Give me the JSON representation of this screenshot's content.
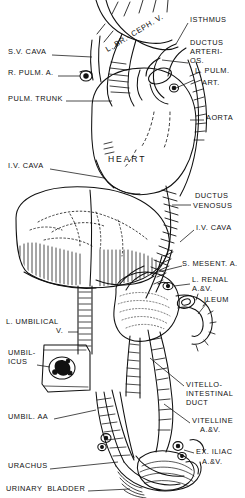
{
  "figure": {
    "width": 245,
    "height": 498,
    "ink_color": "#111111",
    "background_color": "#ffffff",
    "style": "pen-and-ink line engraving"
  },
  "labels_left": [
    {
      "id": "sv-cava",
      "text": "S.V. CAVA",
      "x": 8,
      "y": 52,
      "leader_to": [
        92,
        57
      ]
    },
    {
      "id": "r-pulm-a",
      "text": "R. PULM. A.",
      "x": 8,
      "y": 73,
      "leader_to": [
        84,
        76
      ]
    },
    {
      "id": "pulm-trunk",
      "text": "PULM. TRUNK",
      "x": 8,
      "y": 99,
      "leader_to": [
        112,
        100
      ]
    },
    {
      "id": "iv-cava-upper",
      "text": "I.V. CAVA",
      "x": 8,
      "y": 166,
      "leader_to": [
        102,
        176
      ]
    },
    {
      "id": "l-umbilical-v",
      "text": "L. UMBILICAL",
      "x": 6,
      "y": 322,
      "leader_to": null
    },
    {
      "id": "l-umbilical-v2",
      "text": "V.",
      "x": 56,
      "y": 331,
      "leader_to": [
        80,
        332
      ]
    },
    {
      "id": "umbilicus-1",
      "text": "UMBIL-",
      "x": 8,
      "y": 353,
      "leader_to": null
    },
    {
      "id": "umbilicus-2",
      "text": "ICUS",
      "x": 8,
      "y": 362,
      "leader_to": [
        50,
        366
      ]
    },
    {
      "id": "umbil-aa",
      "text": "UMBIL. AA",
      "x": 8,
      "y": 417,
      "leader_to": [
        72,
        412
      ]
    },
    {
      "id": "urachus",
      "text": "URACHUS",
      "x": 8,
      "y": 466,
      "leader_to": [
        92,
        468
      ]
    },
    {
      "id": "urinary-bladder",
      "text": "URINARY  BLADDER",
      "x": 6,
      "y": 489,
      "leader_to": [
        118,
        488
      ]
    }
  ],
  "labels_right": [
    {
      "id": "isthmus",
      "text": "ISTHMUS",
      "x": 190,
      "y": 20,
      "leader_to": [
        176,
        44
      ]
    },
    {
      "id": "ductus-arteriosus-1",
      "text": "DUCTUS",
      "x": 190,
      "y": 43,
      "leader_to": null
    },
    {
      "id": "ductus-arteriosus-2",
      "text": "ARTERI-",
      "x": 190,
      "y": 52,
      "leader_to": null
    },
    {
      "id": "ductus-arteriosus-3",
      "text": "OS.",
      "x": 190,
      "y": 61,
      "leader_to": [
        168,
        66
      ]
    },
    {
      "id": "l-pulm-art-1",
      "text": "L. PULM.",
      "x": 195,
      "y": 71,
      "leader_to": null
    },
    {
      "id": "l-pulm-art-2",
      "text": "ART.",
      "x": 202,
      "y": 83,
      "leader_to": [
        170,
        84
      ]
    },
    {
      "id": "aorta",
      "text": "AORTA",
      "x": 206,
      "y": 118,
      "leader_to": [
        190,
        120
      ]
    },
    {
      "id": "ductus-venosus-1",
      "text": "DUCTUS",
      "x": 195,
      "y": 196,
      "leader_to": null
    },
    {
      "id": "ductus-venosus-2",
      "text": "VENOSUS",
      "x": 193,
      "y": 206,
      "leader_to": [
        176,
        207
      ]
    },
    {
      "id": "iv-cava-lower",
      "text": "I.V. CAVA",
      "x": 196,
      "y": 228,
      "leader_to": [
        180,
        238
      ]
    },
    {
      "id": "s-mesent-a",
      "text": "S. MESENT. A.",
      "x": 184,
      "y": 264,
      "leader_to": [
        160,
        272
      ]
    },
    {
      "id": "l-renal-1",
      "text": "L. RENAL",
      "x": 192,
      "y": 280,
      "leader_to": null
    },
    {
      "id": "l-renal-2",
      "text": "A.&V.",
      "x": 192,
      "y": 288,
      "leader_to": [
        178,
        286
      ]
    },
    {
      "id": "ileum",
      "text": "ILEUM",
      "x": 204,
      "y": 300,
      "leader_to": [
        196,
        312
      ]
    },
    {
      "id": "vitello-1",
      "text": "VITELLO-",
      "x": 186,
      "y": 385,
      "leader_to": null
    },
    {
      "id": "vitello-2",
      "text": "INTESTINAL",
      "x": 186,
      "y": 394,
      "leader_to": null
    },
    {
      "id": "vitello-3",
      "text": "DUCT",
      "x": 186,
      "y": 403,
      "leader_to": [
        150,
        360
      ]
    },
    {
      "id": "vitelline-1",
      "text": "VITELLINE",
      "x": 192,
      "y": 421,
      "leader_to": null
    },
    {
      "id": "vitelline-2",
      "text": "A.&V.",
      "x": 200,
      "y": 430,
      "leader_to": [
        160,
        405
      ]
    },
    {
      "id": "ex-iliac-1",
      "text": "EX. ILIAC",
      "x": 196,
      "y": 452,
      "leader_to": [
        182,
        450
      ]
    },
    {
      "id": "ex-iliac-2",
      "text": "A.&V.",
      "x": 202,
      "y": 462,
      "leader_to": null
    }
  ],
  "labels_inline": [
    {
      "id": "heart",
      "text": "HEART",
      "x": 131,
      "y": 160,
      "size": "big"
    },
    {
      "id": "l-br-ceph-v",
      "text": "L. BR.- CEPH. V.",
      "x": 107,
      "y": 38,
      "rotation": -31
    }
  ]
}
